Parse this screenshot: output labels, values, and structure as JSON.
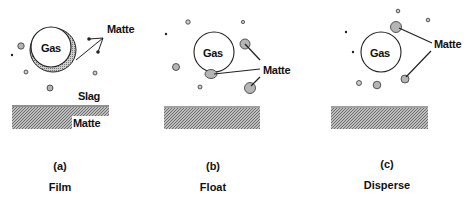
{
  "figure": {
    "panels": [
      {
        "id": "a",
        "letter": "(a)",
        "caption": "Film",
        "gas_label": "Gas",
        "matte_label": "Matte",
        "slag_label": "Slag",
        "bath_label": "Matte"
      },
      {
        "id": "b",
        "letter": "(b)",
        "caption": "Float",
        "gas_label": "Gas",
        "matte_label": "Matte"
      },
      {
        "id": "c",
        "letter": "(c)",
        "caption": "Disperse",
        "gas_label": "Gas",
        "matte_label": "Matte"
      }
    ],
    "colors": {
      "droplet_fill": "#b5b5b5",
      "outline": "#222222",
      "bath_fill": "#9a9a9a",
      "background": "#ffffff"
    }
  }
}
